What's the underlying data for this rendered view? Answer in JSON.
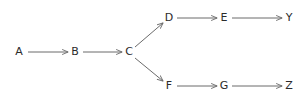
{
  "diagram": {
    "type": "directed-graph",
    "background_color": "#ffffff",
    "edge_color": "#6b6b6b",
    "label_color": "#2b2b2b",
    "edge_width": 1,
    "arrowhead": "open-thin",
    "nodes": [
      {
        "id": "A",
        "label": "A",
        "x": 19,
        "y": 52
      },
      {
        "id": "B",
        "label": "B",
        "x": 75,
        "y": 52
      },
      {
        "id": "C",
        "label": "C",
        "x": 129,
        "y": 52
      },
      {
        "id": "D",
        "label": "D",
        "x": 169,
        "y": 18
      },
      {
        "id": "E",
        "label": "E",
        "x": 224,
        "y": 18
      },
      {
        "id": "Y",
        "label": "Y",
        "x": 289,
        "y": 18
      },
      {
        "id": "F",
        "label": "F",
        "x": 169,
        "y": 86
      },
      {
        "id": "G",
        "label": "G",
        "x": 224,
        "y": 86
      },
      {
        "id": "Z",
        "label": "Z",
        "x": 289,
        "y": 86
      }
    ],
    "edges": [
      {
        "from": "A",
        "to": "B",
        "x1": 28,
        "y1": 52,
        "x2": 68,
        "y2": 52
      },
      {
        "from": "B",
        "to": "C",
        "x1": 83,
        "y1": 52,
        "x2": 122,
        "y2": 52
      },
      {
        "from": "C",
        "to": "D",
        "x1": 135,
        "y1": 47,
        "x2": 163,
        "y2": 23
      },
      {
        "from": "C",
        "to": "F",
        "x1": 135,
        "y1": 58,
        "x2": 163,
        "y2": 81
      },
      {
        "from": "D",
        "to": "E",
        "x1": 177,
        "y1": 18,
        "x2": 217,
        "y2": 18
      },
      {
        "from": "E",
        "to": "Y",
        "x1": 232,
        "y1": 18,
        "x2": 282,
        "y2": 18
      },
      {
        "from": "F",
        "to": "G",
        "x1": 177,
        "y1": 86,
        "x2": 217,
        "y2": 86
      },
      {
        "from": "G",
        "to": "Z",
        "x1": 232,
        "y1": 86,
        "x2": 282,
        "y2": 86
      }
    ]
  }
}
